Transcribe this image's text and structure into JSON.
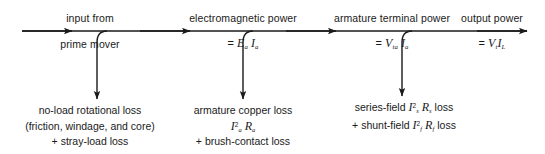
{
  "diagram": {
    "type": "power-flow",
    "stroke_color": "#1a1a1a",
    "background": "#ffffff",
    "width": 545,
    "height": 154,
    "main_axis": {
      "y": 31,
      "x_start": 22,
      "x_end": 527,
      "arrowheads_x": [
        72,
        190,
        336,
        492
      ]
    },
    "stages": [
      {
        "id": "input",
        "top_label": "input from",
        "bottom_label": "prime mover",
        "center_x": 90,
        "has_formula": false
      },
      {
        "id": "electromagnetic",
        "top_label": "electromagnetic power",
        "formula_prefix": "=",
        "formula_terms": [
          {
            "symbol": "E",
            "sub": "a"
          },
          {
            "symbol": "I",
            "sub": "a"
          }
        ],
        "center_x": 243,
        "has_formula": true
      },
      {
        "id": "armature-terminal",
        "top_label": "armature terminal power",
        "formula_prefix": "=",
        "formula_terms": [
          {
            "symbol": "V",
            "sub": "ta"
          },
          {
            "symbol": "I",
            "sub": "a"
          }
        ],
        "center_x": 392,
        "has_formula": true
      },
      {
        "id": "output",
        "top_label": "output power",
        "formula_prefix": "=",
        "formula_terms": [
          {
            "symbol": "V",
            "sub": "t"
          },
          {
            "symbol": "I",
            "sub": "L"
          }
        ],
        "center_x": 492,
        "has_formula": true
      }
    ],
    "branches": [
      {
        "id": "no-load-rotational-loss",
        "tap_x": 107,
        "stem_x": 97,
        "arrow_y": 101,
        "label_center_x": 90,
        "lines": [
          {
            "text": "no-load rotational loss"
          },
          {
            "text": "(friction, windage, and core)"
          },
          {
            "text": "+ stray-load loss"
          }
        ]
      },
      {
        "id": "armature-copper-loss",
        "tap_x": 253,
        "stem_x": 243,
        "arrow_y": 101,
        "label_center_x": 243,
        "lines": [
          {
            "text": "armature copper loss"
          },
          {
            "text": "I2a Ra",
            "math": true
          },
          {
            "text": "+ brush-contact loss"
          }
        ]
      },
      {
        "id": "field-losses",
        "tap_x": 412,
        "stem_x": 402,
        "arrow_y": 98,
        "label_center_x": 404,
        "lines": [
          {
            "text": "series-field I2s Rs loss",
            "math": true
          },
          {
            "text": "+ shunt-field I2f Rf loss",
            "math": true
          }
        ]
      }
    ],
    "labels": {
      "input_from": "input from",
      "prime_mover": "prime mover",
      "electromagnetic_power": "electromagnetic power",
      "armature_terminal_power": "armature terminal power",
      "output_power": "output power",
      "no_load_line1": "no-load rotational loss",
      "no_load_line2": "(friction, windage, and core)",
      "no_load_line3": "+ stray-load loss",
      "armature_line1": "armature copper loss",
      "armature_line3": "+ brush-contact loss",
      "series_field_prefix": "series-field",
      "series_field_suffix": "loss",
      "shunt_field_prefix": "+ shunt-field",
      "shunt_field_suffix": "loss",
      "equals": "=",
      "E_symbol": "E",
      "V_symbol": "V",
      "I_symbol": "I",
      "R_symbol": "R",
      "sub_a": "a",
      "sub_ta": "ta",
      "sub_t": "t",
      "sub_L": "L",
      "sub_s": "s",
      "sub_f": "f",
      "sup_2": "2"
    }
  }
}
